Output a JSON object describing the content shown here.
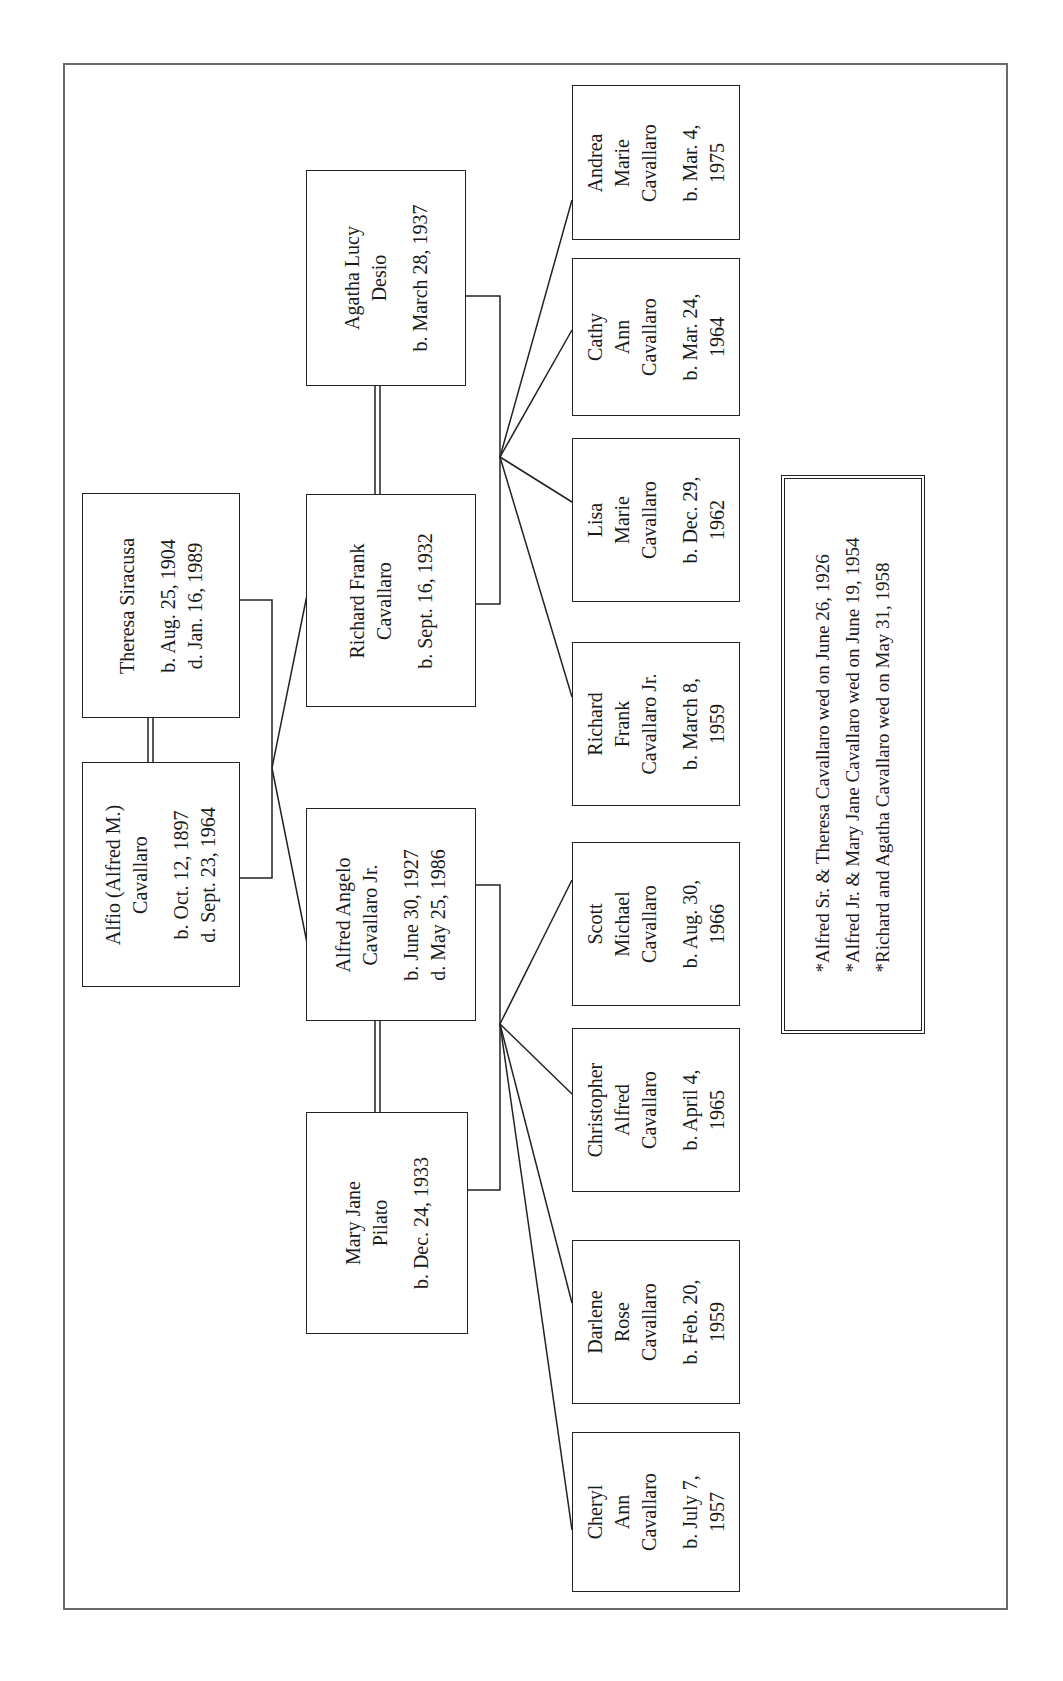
{
  "diagram": {
    "type": "family-tree",
    "orientation": "rotated-90-ccw",
    "generation_1": [
      {
        "id": "alfio",
        "name_lines": [
          "Alfio (Alfred M.)",
          "Cavallaro"
        ],
        "dates": [
          "b. Oct. 12, 1897",
          "d. Sept. 23, 1964"
        ]
      },
      {
        "id": "theresa",
        "name_lines": [
          "Theresa Siracusa"
        ],
        "dates": [
          "b. Aug. 25, 1904",
          "d. Jan. 16, 1989"
        ]
      }
    ],
    "generation_2": [
      {
        "id": "alfred_jr",
        "name_lines": [
          "Alfred Angelo",
          "Cavallaro Jr."
        ],
        "dates": [
          "b. June 30, 1927",
          "d. May 25, 1986"
        ]
      },
      {
        "id": "mary_jane",
        "name_lines": [
          "Mary Jane",
          "Pilato"
        ],
        "dates": [
          "b. Dec. 24, 1933"
        ]
      },
      {
        "id": "richard",
        "name_lines": [
          "Richard Frank",
          "Cavallaro"
        ],
        "dates": [
          "b. Sept. 16, 1932"
        ]
      },
      {
        "id": "agatha",
        "name_lines": [
          "Agatha Lucy",
          "Desio"
        ],
        "dates": [
          "b. March 28, 1937"
        ]
      }
    ],
    "generation_3_alfred": [
      {
        "id": "cheryl",
        "name_lines": [
          "Cheryl",
          "Ann",
          "Cavallaro"
        ],
        "dates": [
          "b. July 7,",
          "1957"
        ]
      },
      {
        "id": "darlene",
        "name_lines": [
          "Darlene",
          "Rose",
          "Cavallaro"
        ],
        "dates": [
          "b. Feb. 20,",
          "1959"
        ]
      },
      {
        "id": "christopher",
        "name_lines": [
          "Christopher",
          "Alfred",
          "Cavallaro"
        ],
        "dates": [
          "b. April 4,",
          "1965"
        ]
      },
      {
        "id": "scott",
        "name_lines": [
          "Scott",
          "Michael",
          "Cavallaro"
        ],
        "dates": [
          "b. Aug. 30,",
          "1966"
        ]
      }
    ],
    "generation_3_richard": [
      {
        "id": "richard_jr",
        "name_lines": [
          "Richard",
          "Frank",
          "Cavallaro Jr."
        ],
        "dates": [
          "b. March 8,",
          "1959"
        ]
      },
      {
        "id": "lisa",
        "name_lines": [
          "Lisa",
          "Marie",
          "Cavallaro"
        ],
        "dates": [
          "b. Dec. 29,",
          "1962"
        ]
      },
      {
        "id": "cathy",
        "name_lines": [
          "Cathy",
          "Ann",
          "Cavallaro"
        ],
        "dates": [
          "b. Mar. 24,",
          "1964"
        ]
      },
      {
        "id": "andrea",
        "name_lines": [
          "Andrea",
          "Marie",
          "Cavallaro"
        ],
        "dates": [
          "b. Mar. 4,",
          "1975"
        ]
      }
    ],
    "marriages_note": [
      "*Alfred Sr. & Theresa Cavallaro wed on June 26, 1926",
      "*Alfred Jr. & Mary Jane Cavallaro wed on June 19, 1954",
      "*Richard and Agatha Cavallaro wed on May 31, 1958"
    ],
    "colors": {
      "line": "#222222",
      "frame": "#6a6a6a",
      "background": "#ffffff"
    }
  }
}
